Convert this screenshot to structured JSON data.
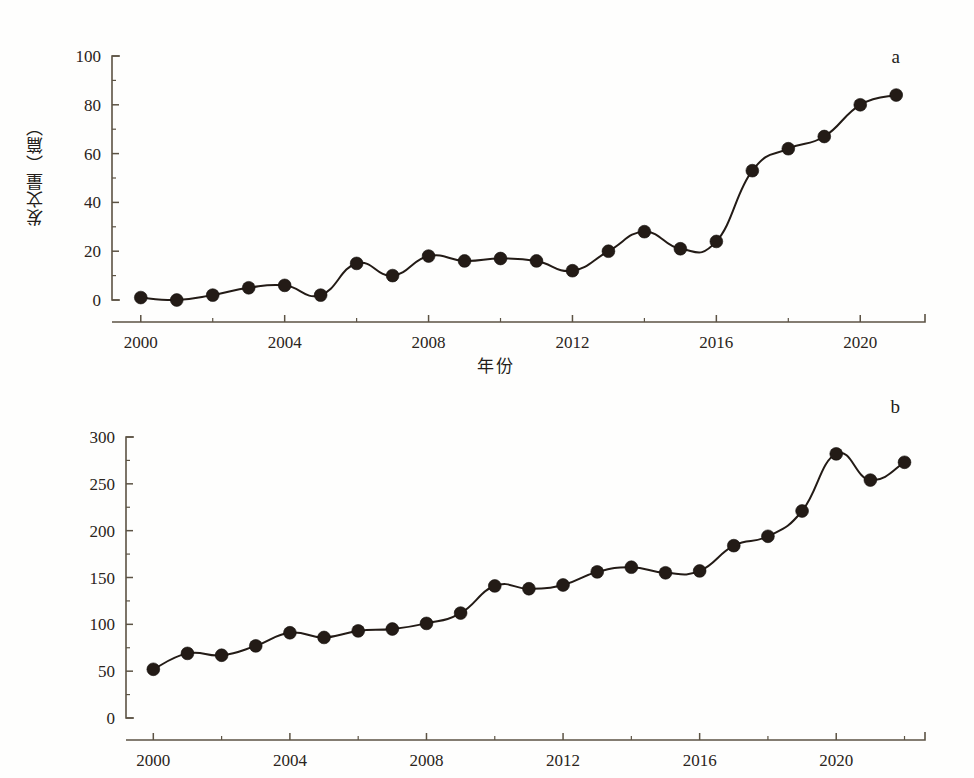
{
  "figure": {
    "background_color": "#fefefd",
    "ink_color": "#231b16",
    "axis_color": "#5c5344"
  },
  "panels": [
    {
      "tag": "a",
      "ylabel": "发文量（篇）",
      "xlabel": "年份"
    },
    {
      "tag": "b",
      "ylabel": "发文量（篇）",
      "xlabel": "年份"
    }
  ],
  "chart_data": [
    {
      "type": "line",
      "title": "a",
      "xlabel": "年份",
      "ylabel": "发文量（篇）",
      "x": [
        2000,
        2001,
        2002,
        2003,
        2004,
        2005,
        2006,
        2007,
        2008,
        2009,
        2010,
        2011,
        2012,
        2013,
        2014,
        2015,
        2016,
        2017,
        2018,
        2019,
        2020,
        2021
      ],
      "values": [
        1,
        0,
        2,
        5,
        6,
        2,
        15,
        10,
        18,
        16,
        17,
        16,
        12,
        20,
        28,
        21,
        24,
        53,
        62,
        67,
        80,
        84
      ],
      "xlim": [
        1999.2,
        2021.8
      ],
      "ylim": [
        0,
        100
      ],
      "xticks": [
        2000,
        2004,
        2008,
        2012,
        2016,
        2020
      ],
      "xtick_labels": [
        "2000",
        "2004",
        "2008",
        "2012",
        "2016",
        "2020"
      ],
      "xminor_step": 2,
      "yticks": [
        0,
        20,
        40,
        60,
        80,
        100
      ],
      "ytick_labels": [
        "0",
        "20",
        "40",
        "60",
        "80",
        "100"
      ],
      "yminor_step": 10,
      "grid": false,
      "legend": "none",
      "marker": "filled-circle"
    },
    {
      "type": "line",
      "title": "b",
      "xlabel": "年份",
      "ylabel": "发文量（篇）",
      "x": [
        2000,
        2001,
        2002,
        2003,
        2004,
        2005,
        2006,
        2007,
        2008,
        2009,
        2010,
        2011,
        2012,
        2013,
        2014,
        2015,
        2016,
        2017,
        2018,
        2019,
        2020,
        2021,
        2022
      ],
      "values": [
        52,
        69,
        67,
        77,
        91,
        86,
        93,
        95,
        101,
        112,
        141,
        138,
        142,
        156,
        161,
        155,
        157,
        184,
        194,
        221,
        282,
        254,
        273
      ],
      "xlim": [
        1999.2,
        2022.6
      ],
      "ylim": [
        0,
        300
      ],
      "xticks": [
        2000,
        2004,
        2008,
        2012,
        2016,
        2020
      ],
      "xtick_labels": [
        "2000",
        "2004",
        "2008",
        "2012",
        "2016",
        "2020"
      ],
      "xminor_step": 2,
      "yticks": [
        0,
        50,
        100,
        150,
        200,
        250,
        300
      ],
      "ytick_labels": [
        "0",
        "50",
        "100",
        "150",
        "200",
        "250",
        "300"
      ],
      "yminor_step": 25,
      "grid": false,
      "legend": "none",
      "marker": "filled-circle"
    }
  ]
}
